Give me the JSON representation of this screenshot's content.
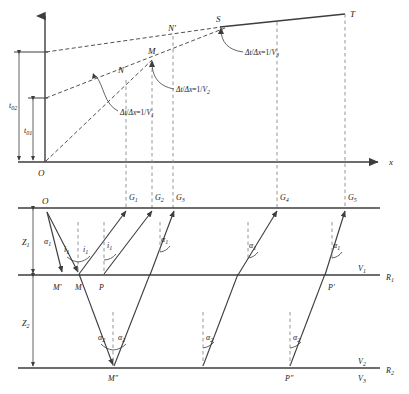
{
  "figure": {
    "type": "seismic-refraction-diagram",
    "colors": {
      "line": "#3d3d3d",
      "dashed": "#8a8a8a",
      "text": "#1a1a1a",
      "background": "#ffffff"
    }
  },
  "traveltime_plot": {
    "axis_x_label": "x",
    "origin_label": "O",
    "intercept_labels": [
      {
        "name": "t02",
        "text": "t",
        "subscript": "02"
      },
      {
        "name": "t01",
        "text": "t",
        "subscript": "01"
      }
    ],
    "curve_points": [
      {
        "label": "N",
        "subscript": ""
      },
      {
        "label": "M",
        "subscript": ""
      },
      {
        "label": "N'",
        "subscript": ""
      },
      {
        "label": "S",
        "subscript": ""
      },
      {
        "label": "T",
        "subscript": ""
      }
    ],
    "slope_annotations": [
      {
        "name": "slope-v1",
        "text": "Δt/Δx=1/V",
        "subscript": "1"
      },
      {
        "name": "slope-v2",
        "text": "Δt/Δx=1/V",
        "subscript": "2"
      },
      {
        "name": "slope-v3",
        "text": "Δt/Δx=1/V",
        "subscript": "3"
      }
    ]
  },
  "raypath_model": {
    "source_label": "O",
    "geophones": [
      {
        "label": "G",
        "subscript": "1"
      },
      {
        "label": "G",
        "subscript": "2"
      },
      {
        "label": "G",
        "subscript": "3"
      },
      {
        "label": "G",
        "subscript": "4"
      },
      {
        "label": "G",
        "subscript": "5"
      }
    ],
    "layer_thickness": [
      {
        "label": "Z",
        "subscript": "1"
      },
      {
        "label": "Z",
        "subscript": "2"
      }
    ],
    "velocities": [
      {
        "label": "V",
        "subscript": "1"
      },
      {
        "label": "V",
        "subscript": "2"
      },
      {
        "label": "V",
        "subscript": "3"
      }
    ],
    "interfaces": [
      {
        "label": "R",
        "subscript": "1"
      },
      {
        "label": "R",
        "subscript": "2"
      }
    ],
    "reflection_points": [
      {
        "label": "M'",
        "subscript": ""
      },
      {
        "label": "M",
        "subscript": ""
      },
      {
        "label": "P",
        "subscript": ""
      },
      {
        "label": "M\"",
        "subscript": ""
      },
      {
        "label": "P'",
        "subscript": ""
      },
      {
        "label": "P\"",
        "subscript": ""
      }
    ],
    "angles_layer1": [
      {
        "label": "α",
        "subscript": "1",
        "name": "alpha1-source"
      },
      {
        "label": "i",
        "subscript": "1",
        "name": "i1-left"
      },
      {
        "label": "i",
        "subscript": "1",
        "name": "i1-right"
      },
      {
        "label": "i",
        "subscript": "1",
        "name": "i1-third"
      },
      {
        "label": "α",
        "subscript": "1",
        "name": "alpha1-g3"
      },
      {
        "label": "α",
        "subscript": "1",
        "name": "alpha1-g4"
      },
      {
        "label": "α",
        "subscript": "1",
        "name": "alpha1-g5"
      }
    ],
    "angles_layer2": [
      {
        "label": "α",
        "subscript": "2",
        "name": "alpha2-left"
      },
      {
        "label": "α",
        "subscript": "2",
        "name": "alpha2-right"
      },
      {
        "label": "α",
        "subscript": "2",
        "name": "alpha2-mid"
      },
      {
        "label": "α",
        "subscript": "2",
        "name": "alpha2-far"
      }
    ]
  }
}
